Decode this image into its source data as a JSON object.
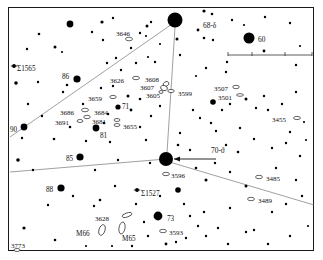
{
  "chart_data": {
    "type": "scatter",
    "title": "",
    "xlabel": "",
    "ylabel": "",
    "grid": false,
    "legend": null,
    "background": "#ffffff",
    "ink_color": "#000000",
    "line_color": "#777777",
    "frame": {
      "x": 8,
      "y": 7,
      "w": 306,
      "h": 244
    },
    "labels": [
      {
        "text": "3646",
        "x": 116,
        "y": 31,
        "size": 7.0,
        "anchor": "start"
      },
      {
        "text": "68-δ",
        "x": 203,
        "y": 22,
        "size": 7.4,
        "anchor": "start"
      },
      {
        "text": "60",
        "x": 258,
        "y": 36,
        "size": 7.4,
        "anchor": "start"
      },
      {
        "text": "Σ1565",
        "x": 17,
        "y": 66,
        "size": 7.2,
        "anchor": "start"
      },
      {
        "text": "86",
        "x": 62,
        "y": 74,
        "size": 7.2,
        "anchor": "start"
      },
      {
        "text": "3626",
        "x": 110,
        "y": 78,
        "size": 7.0,
        "anchor": "start"
      },
      {
        "text": "3608",
        "x": 145,
        "y": 77,
        "size": 7.0,
        "anchor": "start"
      },
      {
        "text": "3599",
        "x": 178,
        "y": 91,
        "size": 7.0,
        "anchor": "start"
      },
      {
        "text": "3507",
        "x": 214,
        "y": 86,
        "size": 7.0,
        "anchor": "start"
      },
      {
        "text": "3501",
        "x": 218,
        "y": 95,
        "size": 7.0,
        "anchor": "start"
      },
      {
        "text": "3607",
        "x": 140,
        "y": 85,
        "size": 7.0,
        "anchor": "start"
      },
      {
        "text": "3605",
        "x": 146,
        "y": 93,
        "size": 7.0,
        "anchor": "start"
      },
      {
        "text": "3659",
        "x": 88,
        "y": 96,
        "size": 7.0,
        "anchor": "start"
      },
      {
        "text": "71",
        "x": 122,
        "y": 104,
        "size": 7.2,
        "anchor": "start"
      },
      {
        "text": "3455",
        "x": 272,
        "y": 117,
        "size": 7.0,
        "anchor": "start"
      },
      {
        "text": "3686",
        "x": 60,
        "y": 110,
        "size": 7.0,
        "anchor": "start"
      },
      {
        "text": "3684",
        "x": 94,
        "y": 110,
        "size": 7.0,
        "anchor": "start"
      },
      {
        "text": "3691",
        "x": 55,
        "y": 120,
        "size": 7.0,
        "anchor": "start"
      },
      {
        "text": "3681",
        "x": 92,
        "y": 119,
        "size": 7.0,
        "anchor": "start"
      },
      {
        "text": "3655",
        "x": 123,
        "y": 124,
        "size": 7.0,
        "anchor": "start"
      },
      {
        "text": "90",
        "x": 10,
        "y": 127,
        "size": 7.2,
        "anchor": "start"
      },
      {
        "text": "81",
        "x": 100,
        "y": 133,
        "size": 7.2,
        "anchor": "start"
      },
      {
        "text": "85",
        "x": 66,
        "y": 156,
        "size": 7.2,
        "anchor": "start"
      },
      {
        "text": "70-ϑ",
        "x": 211,
        "y": 147,
        "size": 7.4,
        "anchor": "start"
      },
      {
        "text": "3596",
        "x": 171,
        "y": 173,
        "size": 7.0,
        "anchor": "start"
      },
      {
        "text": "3485",
        "x": 266,
        "y": 176,
        "size": 7.0,
        "anchor": "start"
      },
      {
        "text": "88",
        "x": 46,
        "y": 187,
        "size": 7.2,
        "anchor": "start"
      },
      {
        "text": "Σ1527",
        "x": 141,
        "y": 191,
        "size": 7.2,
        "anchor": "start"
      },
      {
        "text": "3489",
        "x": 258,
        "y": 198,
        "size": 7.0,
        "anchor": "start"
      },
      {
        "text": "3628",
        "x": 95,
        "y": 216,
        "size": 7.0,
        "anchor": "start"
      },
      {
        "text": "73",
        "x": 167,
        "y": 216,
        "size": 7.2,
        "anchor": "start"
      },
      {
        "text": "M66",
        "x": 76,
        "y": 231,
        "size": 7.2,
        "anchor": "start"
      },
      {
        "text": "M65",
        "x": 122,
        "y": 236,
        "size": 7.2,
        "anchor": "start"
      },
      {
        "text": "3593",
        "x": 169,
        "y": 230,
        "size": 7.0,
        "anchor": "start"
      },
      {
        "text": "3773",
        "x": 11,
        "y": 243,
        "size": 7.0,
        "anchor": "start"
      }
    ],
    "named_stars": [
      {
        "name": "68-delta",
        "label": "68-δ",
        "x": 175,
        "y": 20,
        "r": 7.5
      },
      {
        "name": "60",
        "label": "60",
        "x": 249,
        "y": 38,
        "r": 5.5
      },
      {
        "name": "86",
        "label": "86",
        "x": 77,
        "y": 79,
        "r": 3.6
      },
      {
        "name": "71",
        "label": "71",
        "x": 118,
        "y": 107,
        "r": 2.6
      },
      {
        "name": "3501-star",
        "label": "",
        "x": 213,
        "y": 102,
        "r": 2.8
      },
      {
        "name": "90",
        "label": "90",
        "x": 24,
        "y": 127,
        "r": 3.4
      },
      {
        "name": "81",
        "label": "81",
        "x": 96,
        "y": 128,
        "r": 3.4
      },
      {
        "name": "85",
        "label": "85",
        "x": 80,
        "y": 157,
        "r": 3.6
      },
      {
        "name": "70-theta",
        "label": "70-ϑ",
        "x": 166,
        "y": 159,
        "r": 7.0
      },
      {
        "name": "88",
        "label": "88",
        "x": 61,
        "y": 188,
        "r": 3.6
      },
      {
        "name": "sigma1527-comp",
        "label": "",
        "x": 178,
        "y": 190,
        "r": 2.8
      },
      {
        "name": "73",
        "label": "73",
        "x": 158,
        "y": 216,
        "r": 4.4
      }
    ],
    "double_stars": [
      {
        "name": "Σ1565",
        "x": 14,
        "y": 66
      },
      {
        "name": "Σ1527",
        "x": 137,
        "y": 190
      }
    ],
    "galaxies": [
      {
        "name": "3646",
        "x": 129,
        "y": 39,
        "w": 7,
        "h": 3.6,
        "rot": 0
      },
      {
        "name": "3626",
        "x": 136,
        "y": 78,
        "w": 7,
        "h": 3.4,
        "rot": 0
      },
      {
        "name": "3608",
        "x": 166,
        "y": 84,
        "w": 6,
        "h": 4.5,
        "rot": -30
      },
      {
        "name": "3607",
        "x": 164,
        "y": 88,
        "w": 7,
        "h": 5,
        "rot": 20
      },
      {
        "name": "3605",
        "x": 161,
        "y": 92,
        "w": 4,
        "h": 3,
        "rot": 0
      },
      {
        "name": "3599",
        "x": 171,
        "y": 91,
        "w": 6.5,
        "h": 3.2,
        "rot": 0
      },
      {
        "name": "3507",
        "x": 236,
        "y": 87,
        "w": 6.5,
        "h": 3.4,
        "rot": 0
      },
      {
        "name": "3501",
        "x": 240,
        "y": 95,
        "w": 7,
        "h": 2.6,
        "rot": 0
      },
      {
        "name": "3659",
        "x": 113,
        "y": 97,
        "w": 6.5,
        "h": 3.2,
        "rot": 0
      },
      {
        "name": "3686",
        "x": 85,
        "y": 110,
        "w": 7,
        "h": 3.6,
        "rot": 0
      },
      {
        "name": "3684",
        "x": 87,
        "y": 117,
        "w": 6.5,
        "h": 3.4,
        "rot": 0
      },
      {
        "name": "3691",
        "x": 80,
        "y": 121,
        "w": 6,
        "h": 3,
        "rot": 0
      },
      {
        "name": "3681",
        "x": 117,
        "y": 120,
        "w": 6,
        "h": 3,
        "rot": 0
      },
      {
        "name": "3655",
        "x": 117,
        "y": 125,
        "w": 6,
        "h": 3,
        "rot": 0
      },
      {
        "name": "3455",
        "x": 297,
        "y": 118,
        "w": 7,
        "h": 3.2,
        "rot": 0
      },
      {
        "name": "3596",
        "x": 166,
        "y": 174,
        "w": 7,
        "h": 3.4,
        "rot": 0
      },
      {
        "name": "3485",
        "x": 259,
        "y": 177,
        "w": 7,
        "h": 3.4,
        "rot": 0
      },
      {
        "name": "3489",
        "x": 251,
        "y": 199,
        "w": 7,
        "h": 3.4,
        "rot": 0
      },
      {
        "name": "3628",
        "x": 127,
        "y": 215,
        "w": 10,
        "h": 4,
        "rot": -18
      },
      {
        "name": "3593",
        "x": 163,
        "y": 231,
        "w": 7,
        "h": 3.4,
        "rot": 0
      },
      {
        "name": "3773",
        "x": 17,
        "y": 250,
        "w": 6,
        "h": 3,
        "rot": 0
      },
      {
        "name": "M66",
        "x": 102,
        "y": 230,
        "w": 6,
        "h": 11,
        "rot": 18
      },
      {
        "name": "M65",
        "x": 122,
        "y": 228,
        "w": 6,
        "h": 12,
        "rot": 10
      }
    ],
    "field_stars": [
      {
        "x": 70,
        "y": 24,
        "r": 3.4
      },
      {
        "x": 39,
        "y": 34,
        "r": 1.3
      },
      {
        "x": 102,
        "y": 22,
        "r": 1.6
      },
      {
        "x": 92,
        "y": 32,
        "r": 1.2
      },
      {
        "x": 103,
        "y": 40,
        "r": 1.2
      },
      {
        "x": 113,
        "y": 18,
        "r": 1.2
      },
      {
        "x": 147,
        "y": 26,
        "r": 1.5
      },
      {
        "x": 140,
        "y": 33,
        "r": 1.2
      },
      {
        "x": 146,
        "y": 36,
        "r": 1.1
      },
      {
        "x": 151,
        "y": 22,
        "r": 1.2
      },
      {
        "x": 131,
        "y": 48,
        "r": 1.2
      },
      {
        "x": 160,
        "y": 44,
        "r": 1.1
      },
      {
        "x": 55,
        "y": 47,
        "r": 1.5
      },
      {
        "x": 62,
        "y": 52,
        "r": 1.1
      },
      {
        "x": 27,
        "y": 49,
        "r": 1.2
      },
      {
        "x": 204,
        "y": 11,
        "r": 1.6
      },
      {
        "x": 212,
        "y": 14,
        "r": 1.3
      },
      {
        "x": 198,
        "y": 30,
        "r": 1.4
      },
      {
        "x": 232,
        "y": 20,
        "r": 1.2
      },
      {
        "x": 244,
        "y": 25,
        "r": 1.1
      },
      {
        "x": 265,
        "y": 17,
        "r": 1.2
      },
      {
        "x": 290,
        "y": 23,
        "r": 1.2
      },
      {
        "x": 204,
        "y": 38,
        "r": 1.3
      },
      {
        "x": 213,
        "y": 40,
        "r": 1.2
      },
      {
        "x": 177,
        "y": 39,
        "r": 1.5
      },
      {
        "x": 264,
        "y": 51,
        "r": 1.4
      },
      {
        "x": 180,
        "y": 55,
        "r": 1.2
      },
      {
        "x": 227,
        "y": 62,
        "r": 1.2
      },
      {
        "x": 226,
        "y": 72,
        "r": 1.2
      },
      {
        "x": 206,
        "y": 68,
        "r": 1.2
      },
      {
        "x": 196,
        "y": 76,
        "r": 1.1
      },
      {
        "x": 296,
        "y": 65,
        "r": 1.2
      },
      {
        "x": 300,
        "y": 46,
        "r": 1.1
      },
      {
        "x": 16,
        "y": 83,
        "r": 1.8
      },
      {
        "x": 38,
        "y": 82,
        "r": 1.2
      },
      {
        "x": 67,
        "y": 85,
        "r": 1.3
      },
      {
        "x": 63,
        "y": 92,
        "r": 1.2
      },
      {
        "x": 107,
        "y": 63,
        "r": 1.2
      },
      {
        "x": 116,
        "y": 58,
        "r": 1.2
      },
      {
        "x": 136,
        "y": 63,
        "r": 1.2
      },
      {
        "x": 155,
        "y": 62,
        "r": 1.2
      },
      {
        "x": 148,
        "y": 57,
        "r": 1.1
      },
      {
        "x": 121,
        "y": 70,
        "r": 1.2
      },
      {
        "x": 101,
        "y": 88,
        "r": 1.2
      },
      {
        "x": 113,
        "y": 86,
        "r": 1.2
      },
      {
        "x": 128,
        "y": 96,
        "r": 1.5
      },
      {
        "x": 140,
        "y": 99,
        "r": 1.3
      },
      {
        "x": 131,
        "y": 110,
        "r": 1.4
      },
      {
        "x": 108,
        "y": 114,
        "r": 1.3
      },
      {
        "x": 83,
        "y": 104,
        "r": 1.2
      },
      {
        "x": 70,
        "y": 127,
        "r": 1.3
      },
      {
        "x": 104,
        "y": 123,
        "r": 1.3
      },
      {
        "x": 140,
        "y": 127,
        "r": 1.2
      },
      {
        "x": 151,
        "y": 116,
        "r": 1.2
      },
      {
        "x": 160,
        "y": 106,
        "r": 1.2
      },
      {
        "x": 193,
        "y": 110,
        "r": 1.2
      },
      {
        "x": 200,
        "y": 118,
        "r": 1.2
      },
      {
        "x": 222,
        "y": 110,
        "r": 1.2
      },
      {
        "x": 230,
        "y": 104,
        "r": 1.2
      },
      {
        "x": 246,
        "y": 99,
        "r": 1.5
      },
      {
        "x": 256,
        "y": 108,
        "r": 1.2
      },
      {
        "x": 264,
        "y": 96,
        "r": 1.2
      },
      {
        "x": 268,
        "y": 110,
        "r": 1.2
      },
      {
        "x": 282,
        "y": 104,
        "r": 1.2
      },
      {
        "x": 296,
        "y": 92,
        "r": 1.2
      },
      {
        "x": 211,
        "y": 123,
        "r": 1.2
      },
      {
        "x": 240,
        "y": 128,
        "r": 1.2
      },
      {
        "x": 290,
        "y": 132,
        "r": 1.2
      },
      {
        "x": 304,
        "y": 122,
        "r": 1.1
      },
      {
        "x": 28,
        "y": 104,
        "r": 1.2
      },
      {
        "x": 42,
        "y": 116,
        "r": 1.2
      },
      {
        "x": 22,
        "y": 138,
        "r": 1.2
      },
      {
        "x": 54,
        "y": 139,
        "r": 1.3
      },
      {
        "x": 86,
        "y": 141,
        "r": 1.2
      },
      {
        "x": 110,
        "y": 142,
        "r": 1.2
      },
      {
        "x": 146,
        "y": 140,
        "r": 1.2
      },
      {
        "x": 180,
        "y": 133,
        "r": 1.2
      },
      {
        "x": 178,
        "y": 145,
        "r": 1.3
      },
      {
        "x": 190,
        "y": 150,
        "r": 1.2
      },
      {
        "x": 216,
        "y": 131,
        "r": 1.2
      },
      {
        "x": 226,
        "y": 145,
        "r": 1.2
      },
      {
        "x": 238,
        "y": 152,
        "r": 1.3
      },
      {
        "x": 254,
        "y": 139,
        "r": 1.2
      },
      {
        "x": 272,
        "y": 148,
        "r": 1.2
      },
      {
        "x": 286,
        "y": 143,
        "r": 1.2
      },
      {
        "x": 300,
        "y": 156,
        "r": 1.2
      },
      {
        "x": 306,
        "y": 140,
        "r": 1.1
      },
      {
        "x": 18,
        "y": 160,
        "r": 1.8
      },
      {
        "x": 33,
        "y": 170,
        "r": 1.2
      },
      {
        "x": 95,
        "y": 170,
        "r": 1.2
      },
      {
        "x": 118,
        "y": 160,
        "r": 1.2
      },
      {
        "x": 150,
        "y": 163,
        "r": 1.2
      },
      {
        "x": 196,
        "y": 168,
        "r": 1.3
      },
      {
        "x": 215,
        "y": 163,
        "r": 1.2
      },
      {
        "x": 206,
        "y": 180,
        "r": 1.5
      },
      {
        "x": 230,
        "y": 172,
        "r": 1.2
      },
      {
        "x": 246,
        "y": 186,
        "r": 1.5
      },
      {
        "x": 276,
        "y": 168,
        "r": 1.2
      },
      {
        "x": 296,
        "y": 180,
        "r": 1.2
      },
      {
        "x": 115,
        "y": 186,
        "r": 1.2
      },
      {
        "x": 48,
        "y": 205,
        "r": 1.2
      },
      {
        "x": 73,
        "y": 196,
        "r": 1.2
      },
      {
        "x": 100,
        "y": 200,
        "r": 1.3
      },
      {
        "x": 136,
        "y": 204,
        "r": 1.2
      },
      {
        "x": 160,
        "y": 196,
        "r": 1.2
      },
      {
        "x": 184,
        "y": 204,
        "r": 1.2
      },
      {
        "x": 190,
        "y": 216,
        "r": 1.2
      },
      {
        "x": 204,
        "y": 212,
        "r": 1.2
      },
      {
        "x": 230,
        "y": 208,
        "r": 1.2
      },
      {
        "x": 272,
        "y": 212,
        "r": 1.2
      },
      {
        "x": 286,
        "y": 204,
        "r": 1.2
      },
      {
        "x": 302,
        "y": 196,
        "r": 1.2
      },
      {
        "x": 24,
        "y": 228,
        "r": 1.6
      },
      {
        "x": 55,
        "y": 240,
        "r": 1.3
      },
      {
        "x": 94,
        "y": 206,
        "r": 1.2
      },
      {
        "x": 144,
        "y": 222,
        "r": 1.2
      },
      {
        "x": 148,
        "y": 236,
        "r": 1.2
      },
      {
        "x": 186,
        "y": 238,
        "r": 1.2
      },
      {
        "x": 166,
        "y": 244,
        "r": 1.4
      },
      {
        "x": 176,
        "y": 242,
        "r": 1.2
      },
      {
        "x": 206,
        "y": 236,
        "r": 1.2
      },
      {
        "x": 218,
        "y": 228,
        "r": 1.2
      },
      {
        "x": 246,
        "y": 232,
        "r": 1.2
      },
      {
        "x": 254,
        "y": 230,
        "r": 1.2
      },
      {
        "x": 228,
        "y": 244,
        "r": 1.2
      },
      {
        "x": 268,
        "y": 244,
        "r": 1.2
      },
      {
        "x": 290,
        "y": 236,
        "r": 1.2
      },
      {
        "x": 308,
        "y": 226,
        "r": 1.1
      },
      {
        "x": 198,
        "y": 226,
        "r": 1.2
      },
      {
        "x": 132,
        "y": 246,
        "r": 1.2
      },
      {
        "x": 112,
        "y": 246,
        "r": 1.1
      },
      {
        "x": 86,
        "y": 246,
        "r": 1.1
      }
    ],
    "constellation_lines": [
      {
        "name": "delta-to-theta",
        "x1": 175,
        "y1": 27,
        "x2": 167,
        "y2": 153
      },
      {
        "name": "boundary-upper-left",
        "x1": 10,
        "y1": 137,
        "x2": 175,
        "y2": 22
      },
      {
        "name": "boundary-horizontal",
        "x1": 10,
        "y1": 172,
        "x2": 166,
        "y2": 159
      },
      {
        "name": "boundary-lower-right",
        "x1": 166,
        "y1": 161,
        "x2": 314,
        "y2": 205
      }
    ],
    "arrow": {
      "name": "pointer-to-70-theta",
      "x1": 216,
      "y1": 159,
      "x2": 174,
      "y2": 159
    },
    "scale_bar": {
      "x1": 228,
      "y1": 55,
      "x2": 312,
      "y2": 55,
      "ticks": [
        228,
        252,
        285,
        312
      ]
    }
  },
  "meta": {
    "chart_name": "leo-star-chart"
  }
}
